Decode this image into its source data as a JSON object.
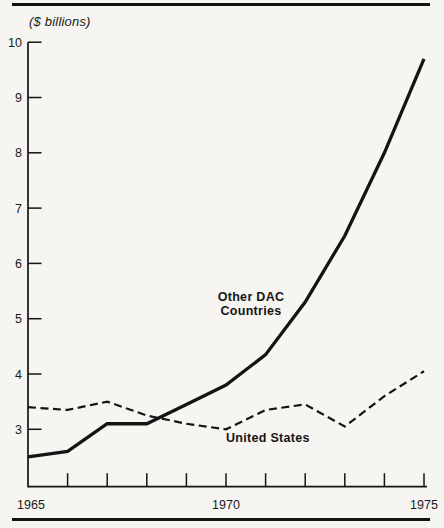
{
  "figure": {
    "unit_label": "($ billions)"
  },
  "chart_data": {
    "type": "line",
    "title": "",
    "ylabel": "($ billions)",
    "xlabel": "",
    "x": [
      1965,
      1966,
      1967,
      1968,
      1969,
      1970,
      1971,
      1972,
      1973,
      1974,
      1975
    ],
    "x_labeled_ticks": [
      1965,
      1970,
      1975
    ],
    "y_ticks": [
      10,
      9,
      8,
      7,
      6,
      5,
      4,
      3
    ],
    "ylim": [
      2.0,
      10.0
    ],
    "grid": false,
    "legend": "inline-labels",
    "series": [
      {
        "name": "Other DAC Countries",
        "style": "solid",
        "values": [
          2.5,
          2.6,
          3.1,
          3.1,
          3.45,
          3.8,
          4.35,
          5.3,
          6.5,
          8.0,
          9.7
        ]
      },
      {
        "name": "United States",
        "style": "dashed",
        "values": [
          3.4,
          3.35,
          3.5,
          3.25,
          3.1,
          3.0,
          3.35,
          3.45,
          3.05,
          3.6,
          4.05
        ]
      }
    ],
    "annotations": [
      {
        "text": "Other DAC\nCountries",
        "series": "Other DAC Countries"
      },
      {
        "text": "United States",
        "series": "United States"
      }
    ],
    "colors": {
      "line": "#141414",
      "text": "#1a1a1a",
      "background": "#f6f5f1"
    }
  }
}
